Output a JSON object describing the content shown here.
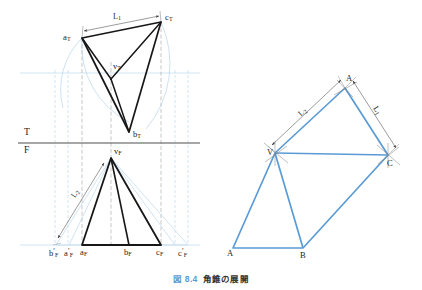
{
  "caption": {
    "figure_number": "図 8.4",
    "text": "角錐の展開"
  },
  "colors": {
    "blue": "#5b9bd5",
    "light_blue": "#bcd9ee",
    "dark": "#1a1a1a",
    "gray": "#8a8a8a",
    "caption_blue": "#5b9bd5"
  },
  "reference_line": {
    "top_label": "T",
    "front_label": "F"
  },
  "top_view": {
    "name": "top-view",
    "vertices": [
      {
        "label_base": "a",
        "label_sub": "T"
      },
      {
        "label_base": "b",
        "label_sub": "T"
      },
      {
        "label_base": "c",
        "label_sub": "T"
      },
      {
        "label_base": "v",
        "label_sub": "T"
      }
    ],
    "labels": {
      "a": "a",
      "a_sub": "T",
      "b": "b",
      "b_sub": "T",
      "c": "c",
      "c_sub": "T",
      "v": "v",
      "v_sub": "T"
    },
    "dimension": {
      "label": "L",
      "sub": "1"
    }
  },
  "front_view": {
    "name": "front-view",
    "labels": {
      "v": "v",
      "v_sub": "F",
      "b_prime": "b",
      "b_prime_sub": "F",
      "a_prime": "a",
      "a_prime_sub": "F",
      "a": "a",
      "a_sub": "F",
      "b": "b",
      "b_sub": "F",
      "c": "c",
      "c_sub": "F",
      "c_prime": "c",
      "c_prime_sub": "F",
      "prime_mark": "′"
    },
    "dimension": {
      "label": "L",
      "sub": "2"
    }
  },
  "development": {
    "name": "development-pattern",
    "labels": {
      "apex": "V",
      "a_top": "A",
      "c": "C",
      "a_bottom": "A",
      "b": "B"
    },
    "dimensions": [
      {
        "label": "L",
        "sub": "2",
        "name": "dimension-L2"
      },
      {
        "label": "L",
        "sub": "1",
        "name": "dimension-L1"
      }
    ]
  }
}
